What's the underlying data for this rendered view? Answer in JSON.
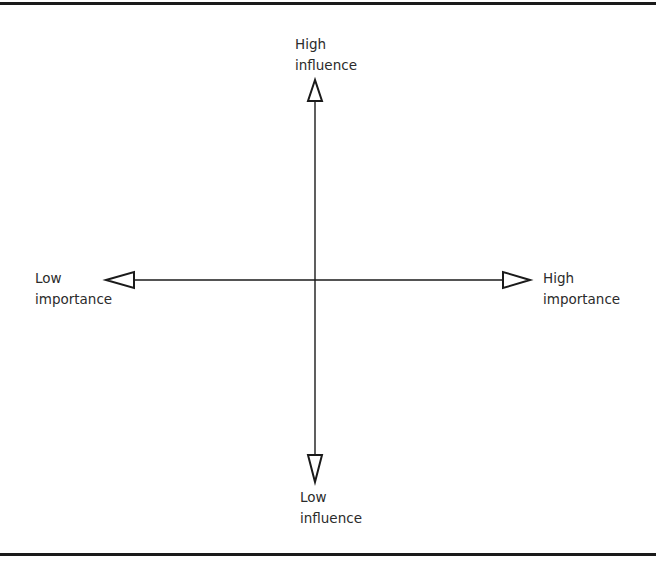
{
  "diagram": {
    "type": "two-axis quadrant grid",
    "axes": {
      "vertical": {
        "top_label": [
          "High",
          "influence"
        ],
        "bottom_label": [
          "Low",
          "influence"
        ]
      },
      "horizontal": {
        "left_label": [
          "Low",
          "importance"
        ],
        "right_label": [
          "High",
          "importance"
        ]
      }
    },
    "colors": {
      "line": "#1a1a1a",
      "text": "#2b2b2b",
      "background": "#ffffff"
    }
  }
}
